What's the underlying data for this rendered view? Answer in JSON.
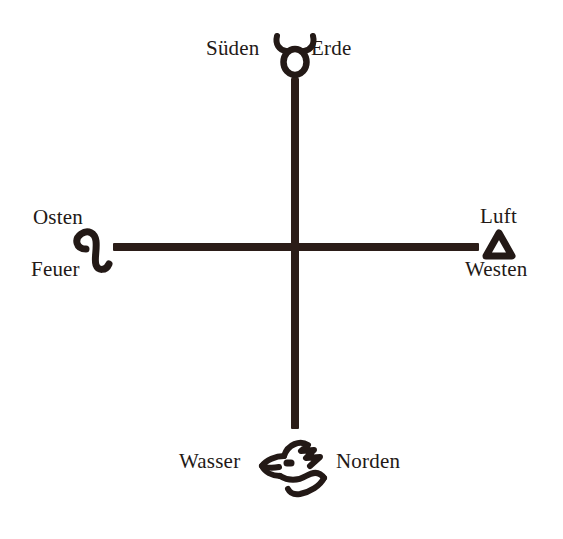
{
  "diagram": {
    "background_color": "#ffffff",
    "ink_color": "#231916",
    "stroke_color": "#2b1d18",
    "axis": {
      "vertical_name": "vertical-axis",
      "horizontal_name": "horizontal-axis"
    },
    "points": [
      {
        "id": "south",
        "direction_label": "Süden",
        "element_label": "Erde",
        "symbol_name": "taurus-symbol",
        "symbol_char": "♉",
        "position": "top"
      },
      {
        "id": "east",
        "direction_label": "Osten",
        "element_label": "Feuer",
        "symbol_name": "leo-symbol",
        "symbol_char": "♌",
        "position": "left"
      },
      {
        "id": "west",
        "direction_label": "Westen",
        "element_label": "Luft",
        "symbol_name": "air-triangle-symbol",
        "symbol_char": "△",
        "position": "right"
      },
      {
        "id": "north",
        "direction_label": "Norden",
        "element_label": "Wasser",
        "symbol_name": "eagle-head-symbol",
        "symbol_char": "🦅",
        "position": "bottom"
      }
    ]
  }
}
